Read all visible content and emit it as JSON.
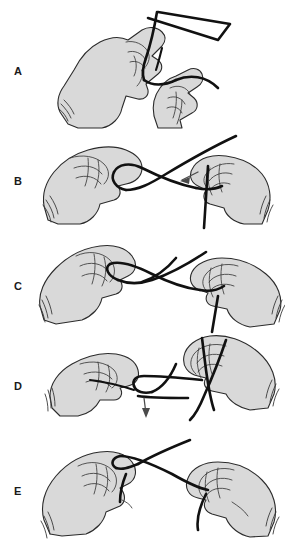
{
  "figure": {
    "background_color": "#ffffff",
    "width": 285,
    "height": 541,
    "skin_fill": "#d9d9d9",
    "outline_color": "#2b2b2b",
    "suture_color": "#111111",
    "arrow_color": "#4a4a4a"
  },
  "panels": [
    {
      "label": "A",
      "label_x": 14,
      "label_y": 66,
      "caption": "Suture strands held between thumb and index fingers forming initial loop"
    },
    {
      "label": "B",
      "label_x": 14,
      "label_y": 176,
      "caption": "Strand passed across and through the loop, arrow indicates direction of strand",
      "arrow": "down-left"
    },
    {
      "label": "C",
      "label_x": 14,
      "label_y": 281,
      "caption": "Hands drawn apart to seat the first throw of the knot"
    },
    {
      "label": "D",
      "label_x": 14,
      "label_y": 381,
      "caption": "Second throw formed, arrow indicates downward tension on the strand",
      "arrow": "down"
    },
    {
      "label": "E",
      "label_x": 14,
      "label_y": 486,
      "caption": "Knot squared and tightened flat between both hands"
    }
  ]
}
